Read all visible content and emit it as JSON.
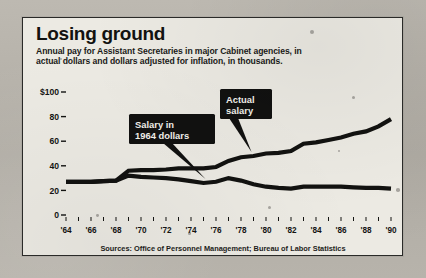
{
  "header": {
    "title": "Losing ground",
    "subtitle_line1": "Annual pay for Assistant Secretaries in major Cabinet agencies, in",
    "subtitle_line2": "actual dollars and dollars adjusted for inflation, in thousands."
  },
  "source": "Sources: Office of Personnel Management; Bureau of Labor Statistics",
  "callouts": {
    "actual": {
      "line1": "Actual",
      "line2": "salary"
    },
    "constant": {
      "line1": "Salary in",
      "line2": "1964 dollars"
    }
  },
  "colors": {
    "ink": "#121210",
    "paper": "#eceae3",
    "callout_bg": "#111110",
    "callout_text": "#f4f2ec"
  },
  "chart_data": {
    "type": "line",
    "title": "Losing ground",
    "subtitle": "Annual pay for Assistant Secretaries in major Cabinet agencies, in actual dollars and dollars adjusted for inflation, in thousands.",
    "xlabel": "",
    "ylabel": "",
    "ylim": [
      0,
      100
    ],
    "xlim": [
      1964,
      1990
    ],
    "grid": false,
    "legend_position": "inline-callouts",
    "ytick_labels": [
      "$100",
      "80",
      "60",
      "40",
      "20",
      "0"
    ],
    "ytick_values": [
      100,
      80,
      60,
      40,
      20,
      0
    ],
    "xtick_labels": [
      "'64",
      "'66",
      "'68",
      "'70",
      "'72",
      "'74",
      "'76",
      "'78",
      "'80",
      "'82",
      "'84",
      "'86",
      "'88",
      "'90"
    ],
    "xtick_values": [
      1964,
      1966,
      1968,
      1970,
      1972,
      1974,
      1976,
      1978,
      1980,
      1982,
      1984,
      1986,
      1988,
      1990
    ],
    "minor_ticks_every": 1,
    "x": [
      1964,
      1965,
      1966,
      1967,
      1968,
      1969,
      1970,
      1971,
      1972,
      1973,
      1974,
      1975,
      1976,
      1977,
      1978,
      1979,
      1980,
      1981,
      1982,
      1983,
      1984,
      1985,
      1986,
      1987,
      1988,
      1989,
      1990
    ],
    "series": [
      {
        "name": "Actual salary",
        "values": [
          27,
          27,
          27,
          27.5,
          28,
          36,
          36.5,
          36.5,
          37,
          38,
          38,
          38,
          39,
          44,
          47,
          48,
          50,
          50.5,
          52,
          58,
          59,
          61,
          63,
          66,
          68,
          72,
          78
        ]
      },
      {
        "name": "Salary in 1964 dollars",
        "values": [
          27,
          27,
          27,
          27.5,
          28,
          32,
          31,
          30.5,
          30,
          29,
          27.5,
          26,
          27,
          30,
          28,
          25,
          23,
          22,
          21.5,
          23,
          23,
          23,
          23,
          22.5,
          22,
          22,
          21.5
        ]
      }
    ],
    "annotations": [
      {
        "text": "Actual salary",
        "points_to_year": 1979,
        "points_to_value": 48
      },
      {
        "text": "Salary in 1964 dollars",
        "points_to_year": 1975,
        "points_to_value": 26
      }
    ]
  }
}
